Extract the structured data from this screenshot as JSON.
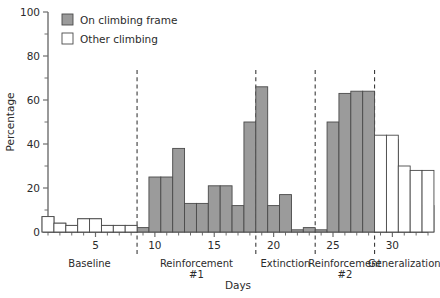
{
  "chart_data": {
    "type": "bar",
    "title": "",
    "xlabel": "Days",
    "ylabel": "Percentage",
    "ylim": [
      0,
      100
    ],
    "xlim": [
      1,
      33
    ],
    "grid": false,
    "legend_position": "top-left",
    "y_ticks_major": [
      0,
      20,
      40,
      60,
      80,
      100
    ],
    "y_ticks_minor": [
      10,
      30,
      50,
      70,
      90
    ],
    "x_ticks_labeled": [
      5,
      10,
      15,
      20,
      25,
      30
    ],
    "legend": [
      {
        "name": "On climbing frame",
        "swatch": "filled",
        "color": "#9b9b9b"
      },
      {
        "name": "Other climbing",
        "swatch": "open",
        "color": "#ffffff"
      }
    ],
    "phases": [
      {
        "label": "Baseline",
        "label_line2": "",
        "start_day": 1,
        "end_day": 8
      },
      {
        "label": "Reinforcement",
        "label_line2": "#1",
        "start_day": 9,
        "end_day": 18
      },
      {
        "label": "Extinction",
        "label_line2": "",
        "start_day": 19,
        "end_day": 23
      },
      {
        "label": "Reinforcement",
        "label_line2": "#2",
        "start_day": 24,
        "end_day": 28
      },
      {
        "label": "Generalization",
        "label_line2": "",
        "start_day": 29,
        "end_day": 33
      }
    ],
    "separator_days": [
      8.5,
      18.5,
      23.5,
      28.5
    ],
    "series": [
      {
        "name": "On climbing frame",
        "style": "filled",
        "x": [
          1,
          2,
          3,
          4,
          5,
          6,
          7,
          8,
          9,
          10,
          11,
          12,
          13,
          14,
          15,
          16,
          17,
          18,
          19,
          20,
          21,
          22,
          23,
          24,
          25,
          26,
          27,
          28,
          29,
          30,
          31,
          32,
          33
        ],
        "values": [
          7,
          4,
          3,
          6,
          6,
          3,
          3,
          3,
          2,
          25,
          25,
          38,
          13,
          13,
          21,
          21,
          12,
          50,
          66,
          12,
          17,
          1,
          2,
          1,
          50,
          63,
          64,
          64,
          42,
          42,
          14,
          3,
          12
        ]
      },
      {
        "name": "Other climbing",
        "style": "open",
        "x": [
          1,
          2,
          3,
          4,
          5,
          6,
          7,
          8,
          29,
          30,
          31,
          32,
          33
        ],
        "values": [
          7,
          4,
          3,
          6,
          6,
          3,
          3,
          3,
          44,
          44,
          30,
          28,
          28
        ]
      }
    ]
  }
}
